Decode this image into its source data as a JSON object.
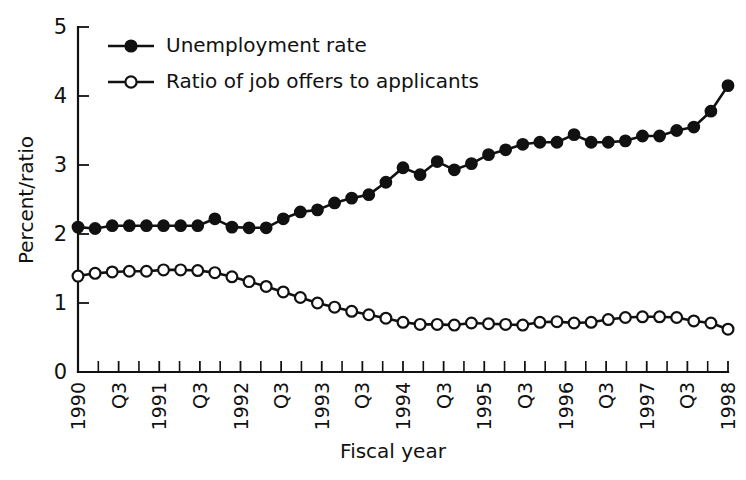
{
  "chart_data": {
    "type": "line",
    "title": "",
    "xlabel": "Fiscal year",
    "ylabel": "Percent/ratio",
    "ylim": [
      0,
      5
    ],
    "yticks": [
      0,
      1,
      2,
      3,
      4,
      5
    ],
    "grid": false,
    "legend_position": "top-left",
    "x_tick_labels": [
      "1990",
      "Q3",
      "1991",
      "Q3",
      "1992",
      "Q3",
      "1993",
      "Q3",
      "1994",
      "Q3",
      "1995",
      "Q3",
      "1996",
      "Q3",
      "1997",
      "Q3",
      "1998"
    ],
    "x_points": [
      "1990 Q1",
      "1990 Q2",
      "1990 Q3",
      "1990 Q4",
      "1991 Q1",
      "1991 Q2",
      "1991 Q3",
      "1991 Q4",
      "1992 Q1",
      "1992 Q2",
      "1992 Q3",
      "1992 Q4",
      "1993 Q1",
      "1993 Q2",
      "1993 Q3",
      "1993 Q4",
      "1994 Q1",
      "1994 Q2",
      "1994 Q3",
      "1994 Q4",
      "1995 Q1",
      "1995 Q2",
      "1995 Q3",
      "1995 Q4",
      "1996 Q1",
      "1996 Q2",
      "1996 Q3",
      "1996 Q4",
      "1997 Q1",
      "1997 Q2",
      "1997 Q3",
      "1997 Q4",
      "1998 Q1",
      "1998 Q2"
    ],
    "series": [
      {
        "name": "Unemployment rate",
        "marker": "filled-circle",
        "values": [
          2.1,
          2.08,
          2.12,
          2.12,
          2.12,
          2.12,
          2.12,
          2.12,
          2.22,
          2.1,
          2.09,
          2.09,
          2.22,
          2.32,
          2.35,
          2.45,
          2.52,
          2.57,
          2.75,
          2.96,
          2.86,
          3.05,
          2.93,
          3.02,
          3.15,
          3.22,
          3.3,
          3.33,
          3.33,
          3.44,
          3.33,
          3.33,
          3.35,
          3.42,
          3.42,
          3.5,
          3.55,
          3.78,
          4.15
        ]
      },
      {
        "name": "Ratio of job offers to applicants",
        "marker": "open-circle",
        "values": [
          1.39,
          1.43,
          1.45,
          1.46,
          1.46,
          1.48,
          1.48,
          1.47,
          1.44,
          1.38,
          1.31,
          1.24,
          1.16,
          1.08,
          1.0,
          0.94,
          0.88,
          0.83,
          0.78,
          0.72,
          0.69,
          0.69,
          0.68,
          0.71,
          0.7,
          0.69,
          0.68,
          0.72,
          0.73,
          0.71,
          0.72,
          0.76,
          0.79,
          0.8,
          0.8,
          0.79,
          0.74,
          0.71,
          0.62
        ]
      }
    ],
    "legend": [
      {
        "label": "Unemployment rate",
        "marker": "filled-circle"
      },
      {
        "label": "Ratio of job offers to applicants",
        "marker": "open-circle"
      }
    ],
    "colors": {
      "line": "#111111",
      "marker_fill": "#111111",
      "marker_open_fill": "#ffffff",
      "background": "#ffffff"
    }
  }
}
